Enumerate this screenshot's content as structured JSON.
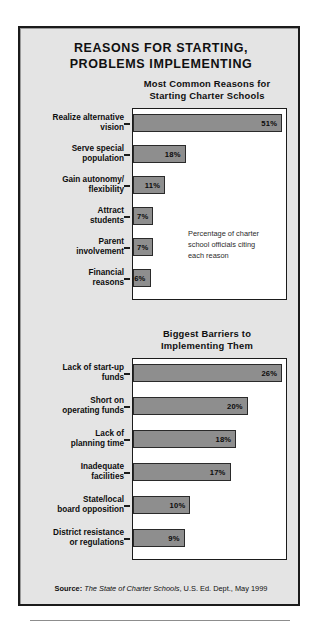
{
  "headline": {
    "line1": "REASONS FOR STARTING,",
    "line2": "PROBLEMS IMPLEMENTING"
  },
  "charts": [
    {
      "title_line1": "Most Common Reasons for",
      "title_line2": "Starting Charter Schools",
      "note_line1": "Percentage of charter",
      "note_line2": "school officials citing",
      "note_line3": "each reason"
    },
    {
      "title_line1": "Biggest Barriers to",
      "title_line2": "Implementing Them"
    }
  ],
  "source": {
    "label": "Source:",
    "title": "The State of Charter Schools",
    "rest": ", U.S. Ed. Dept., May 1999"
  },
  "chart_data": [
    {
      "type": "bar",
      "orientation": "horizontal",
      "title": "Most Common Reasons for Starting Charter Schools",
      "annotation": "Percentage of charter school officials citing each reason",
      "xlabel": "",
      "ylabel": "",
      "xlim": [
        0,
        53
      ],
      "grid": false,
      "legend": "none",
      "categories": [
        "Realize alternative vision",
        "Serve special population",
        "Gain autonomy/ flexibility",
        "Attract students",
        "Parent involvement",
        "Financial reasons"
      ],
      "values": [
        51,
        18,
        11,
        7,
        7,
        6
      ],
      "data_labels": [
        "51%",
        "18%",
        "11%",
        "7%",
        "7%",
        "6%"
      ],
      "category_lines": [
        [
          "Realize alternative",
          "vision"
        ],
        [
          "Serve special",
          "population"
        ],
        [
          "Gain autonomy/",
          "flexibility"
        ],
        [
          "Attract",
          "students"
        ],
        [
          "Parent",
          "involvement"
        ],
        [
          "Financial",
          "reasons"
        ]
      ]
    },
    {
      "type": "bar",
      "orientation": "horizontal",
      "title": "Biggest Barriers to Implementing Them",
      "xlabel": "",
      "ylabel": "",
      "xlim": [
        0,
        27
      ],
      "grid": false,
      "legend": "none",
      "categories": [
        "Lack of start-up funds",
        "Short on operating funds",
        "Lack of planning time",
        "Inadequate facilities",
        "State/local board opposition",
        "District resistance or regulations"
      ],
      "values": [
        26,
        20,
        18,
        17,
        10,
        9
      ],
      "data_labels": [
        "26%",
        "20%",
        "18%",
        "17%",
        "10%",
        "9%"
      ],
      "category_lines": [
        [
          "Lack of start-up",
          "funds"
        ],
        [
          "Short on",
          "operating funds"
        ],
        [
          "Lack of",
          "planning time"
        ],
        [
          "Inadequate",
          "facilities"
        ],
        [
          "State/local",
          "board opposition"
        ],
        [
          "District resistance",
          "or regulations"
        ]
      ]
    }
  ],
  "style": {
    "bar_fill": "#8e8e8e",
    "bar_stroke": "#2a2a2a",
    "panel_bg": "#e4e4e4",
    "plot_bg": "#ffffff",
    "frame": "#1b1b1b"
  }
}
